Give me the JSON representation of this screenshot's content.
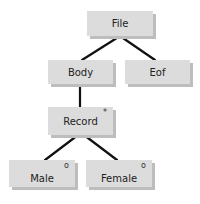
{
  "diagram": {
    "type": "tree",
    "colors": {
      "box_fill": "#dcdcdc",
      "box_shadow": "#bdbdbd",
      "edge": "#111111"
    },
    "nodes": [
      {
        "id": "file",
        "label": "File",
        "mark": ""
      },
      {
        "id": "body",
        "label": "Body",
        "mark": ""
      },
      {
        "id": "eof",
        "label": "Eof",
        "mark": ""
      },
      {
        "id": "record",
        "label": "Record",
        "mark": "*"
      },
      {
        "id": "male",
        "label": "Male",
        "mark": "o"
      },
      {
        "id": "female",
        "label": "Female",
        "mark": "o"
      }
    ],
    "edges": [
      {
        "from": "File",
        "to": "Body"
      },
      {
        "from": "File",
        "to": "Eof"
      },
      {
        "from": "Body",
        "to": "Record"
      },
      {
        "from": "Record",
        "to": "Male"
      },
      {
        "from": "Record",
        "to": "Female"
      }
    ]
  }
}
